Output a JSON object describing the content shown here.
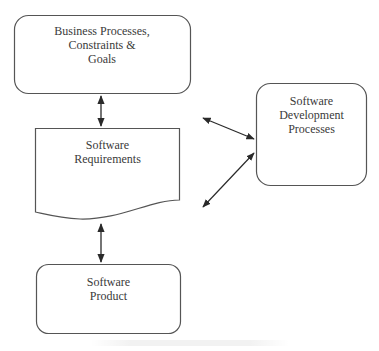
{
  "diagram": {
    "nodes": [
      {
        "id": "business",
        "shape": "rounded-rectangle",
        "lines": [
          "Business Processes,",
          "Constraints &",
          "Goals"
        ]
      },
      {
        "id": "requirements",
        "shape": "document",
        "lines": [
          "Software",
          "Requirements"
        ]
      },
      {
        "id": "product",
        "shape": "rounded-rectangle",
        "lines": [
          "Software",
          "Product"
        ]
      },
      {
        "id": "devprocesses",
        "shape": "rounded-rectangle",
        "lines": [
          "Software",
          "Development",
          "Processes"
        ]
      }
    ],
    "edges": [
      {
        "from": "business",
        "to": "requirements",
        "type": "bidirectional"
      },
      {
        "from": "requirements",
        "to": "product",
        "type": "bidirectional"
      },
      {
        "from": "devprocesses",
        "to": "requirements-top-right",
        "type": "bidirectional"
      },
      {
        "from": "devprocesses",
        "to": "requirements-bottom-right",
        "type": "bidirectional"
      }
    ],
    "colors": {
      "stroke": "#3a3a3a",
      "text": "#3a3a3a",
      "background": "#ffffff"
    }
  }
}
